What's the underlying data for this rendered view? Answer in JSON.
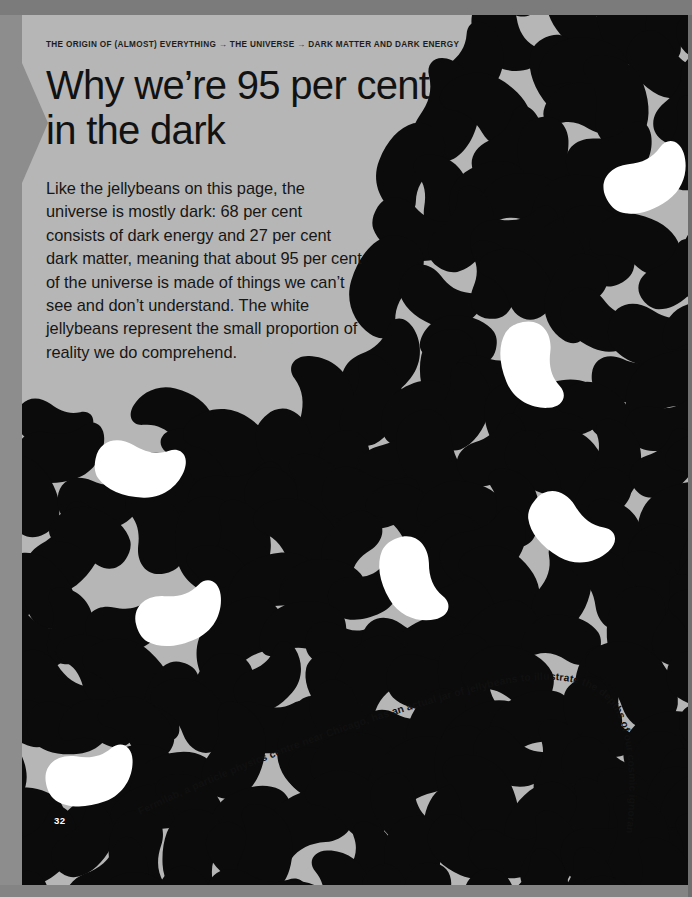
{
  "page": {
    "folio": "32",
    "background_color": "#b6b6b6",
    "bean_dark_color": "#0b0b0b",
    "bean_light_color": "#ffffff",
    "margin_color": "#8d8d8d"
  },
  "breadcrumb": {
    "text": "THE ORIGIN OF (ALMOST) EVERYTHING → THE UNIVERSE → DARK MATTER AND DARK ENERGY",
    "parts": [
      "THE ORIGIN OF (ALMOST) EVERYTHING",
      "THE UNIVERSE",
      "DARK MATTER AND DARK ENERGY"
    ],
    "separator": "→"
  },
  "headline": {
    "text": "Why we’re 95 per cent in the dark"
  },
  "standfirst": {
    "text": "Like the jellybeans on this page, the universe is mostly dark: 68 per cent consists of dark energy and 27 per cent dark matter, meaning that about 95 per cent of the universe is made of things we can’t see and don’t understand. The white jellybeans represent the small proportion of reality we do comprehend."
  },
  "caption": {
    "text": "Fermilab, a particle physics centre near Chicago, has an actual jar of jellybeans to illustrate the depths of our cosmic ignorance"
  },
  "chart_data": {
    "type": "pie",
    "categories": [
      "Dark energy",
      "Dark matter",
      "Ordinary matter we understand"
    ],
    "values": [
      68,
      27,
      5
    ],
    "unit": "per cent",
    "annotations": [
      "68 per cent consists of dark energy",
      "27 per cent dark matter",
      "about 95 per cent of the universe is made of things we can’t see and don’t understand"
    ],
    "encoding": "Dark jellybeans = the 95 per cent we do not understand; white jellybeans = the small proportion of reality we do comprehend",
    "legend": "none",
    "grid": false
  }
}
